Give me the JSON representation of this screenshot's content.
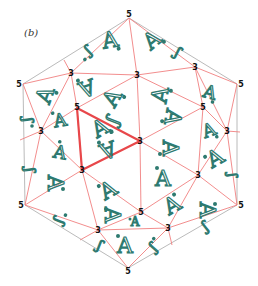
{
  "panel_label": "(b)",
  "colors": {
    "edge": "#f08080",
    "highlight": "#e8474a",
    "outline": "#999999",
    "glyph": "#2e7a70",
    "label": "#111111"
  },
  "vertices": [
    {
      "id": "top",
      "x": 129,
      "y": 18,
      "label": "5"
    },
    {
      "id": "ul",
      "x": 23,
      "y": 84,
      "label": "5"
    },
    {
      "id": "ur",
      "x": 237,
      "y": 84,
      "label": "5"
    },
    {
      "id": "ll",
      "x": 25,
      "y": 205,
      "label": "5"
    },
    {
      "id": "lr",
      "x": 237,
      "y": 205,
      "label": "5"
    },
    {
      "id": "bot",
      "x": 128,
      "y": 268,
      "label": "5"
    },
    {
      "id": "a",
      "x": 71,
      "y": 73,
      "label": "3"
    },
    {
      "id": "b",
      "x": 137,
      "y": 75,
      "label": "3"
    },
    {
      "id": "c",
      "x": 195,
      "y": 67,
      "label": "3"
    },
    {
      "id": "d",
      "x": 77,
      "y": 108,
      "label": "5"
    },
    {
      "id": "e",
      "x": 41,
      "y": 131,
      "label": "3"
    },
    {
      "id": "f",
      "x": 203,
      "y": 107,
      "label": "5"
    },
    {
      "id": "g",
      "x": 227,
      "y": 131,
      "label": "3"
    },
    {
      "id": "h",
      "x": 140,
      "y": 141,
      "label": "3"
    },
    {
      "id": "i",
      "x": 82,
      "y": 170,
      "label": "3"
    },
    {
      "id": "j",
      "x": 198,
      "y": 175,
      "label": "3"
    },
    {
      "id": "k",
      "x": 141,
      "y": 212,
      "label": "5"
    },
    {
      "id": "l",
      "x": 98,
      "y": 230,
      "label": "3"
    },
    {
      "id": "m",
      "x": 168,
      "y": 228,
      "label": "3"
    }
  ],
  "glyph_char": "A"
}
